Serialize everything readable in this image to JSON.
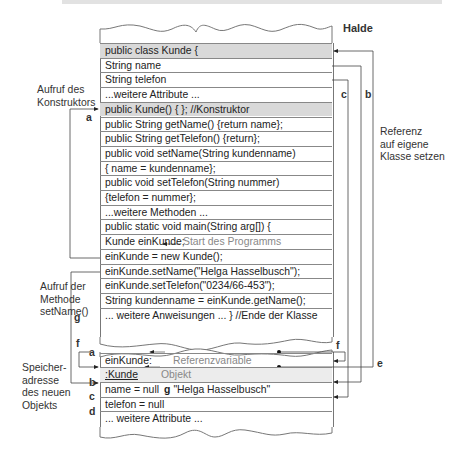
{
  "heap_label": "Halde",
  "class_rows": [
    {
      "text": "public class Kunde {",
      "shade": "gray"
    },
    {
      "text": "String name"
    },
    {
      "text": "String telefon"
    },
    {
      "text": "...weitere Attribute ..."
    },
    {
      "text": "public Kunde() { }; //Konstruktor",
      "shade": "gray"
    },
    {
      "text": "public String getName() {return name};"
    },
    {
      "text": "public String getTelefon() {return};"
    },
    {
      "text": "public void setName(String kundenname)"
    },
    {
      "text": "{ name = kundenname};"
    },
    {
      "text": "public void setTelefon(String nummer)"
    },
    {
      "text": "{telefon = nummer};"
    },
    {
      "text": "...weitere Methoden ..."
    },
    {
      "text": "public static void main(String arg[]) {"
    },
    {
      "text": "Kunde einKunde;",
      "note": "Start des Programms"
    },
    {
      "text": "einKunde = new Kunde();"
    },
    {
      "text": "einKunde.setName(\"Helga Hasselbusch\");"
    },
    {
      "text": "einKunde.setTelefon(\"0234/66-453\");"
    },
    {
      "text": "String kundenname = einKunde.getName();"
    },
    {
      "text": "... weitere Anweisungen ... } //Ende der Klasse"
    }
  ],
  "object_rows": [
    {
      "text": "einKunde:",
      "note": "Referenzvariable"
    },
    {
      "text": ":Kunde",
      "note": "Objekt",
      "shade": "lightgray"
    },
    {
      "text": "name = null",
      "g": "g",
      "value": "\"Helga Hasselbusch\""
    },
    {
      "text": "telefon = null"
    },
    {
      "text": "... weitere Attribute ..."
    }
  ],
  "left_labels": {
    "constructor_call": [
      "Aufruf des",
      "Konstruktors"
    ],
    "method_call": [
      "Aufruf der",
      "Methode",
      "setName()"
    ],
    "memory_address": [
      "Speicher-",
      "adresse",
      "des neuen",
      "Objekts"
    ]
  },
  "right_labels": {
    "reference": [
      "Referenz",
      "auf eigene",
      "Klasse setzen"
    ]
  },
  "letters": {
    "a_top": "a",
    "g_left": "g",
    "f_left": "f",
    "a_obj": "a",
    "b_obj": "b",
    "c_obj": "c",
    "d_obj": "d",
    "b_right": "b",
    "c_right": "c",
    "e_right": "e",
    "f_right": "f"
  }
}
